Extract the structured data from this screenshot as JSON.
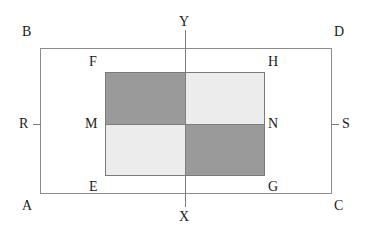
{
  "figure": {
    "type": "geometry-diagram",
    "colors": {
      "background": "#ffffff",
      "outline": "#8c8c8c",
      "inner_outline": "#7a7a7a",
      "axis": "#7d7d7d",
      "shade_dark": "#9a9a9a",
      "shade_light": "#ececec",
      "label_text": "#1a1a1a"
    },
    "outer_rect": {
      "corner_labels": {
        "top_left": "B",
        "top_right": "D",
        "bottom_left": "A",
        "bottom_right": "C"
      }
    },
    "inner_rect": {
      "corner_labels": {
        "top_left": "F",
        "top_right": "H",
        "bottom_left": "E",
        "bottom_right": "G"
      },
      "midline_labels": {
        "left": "M",
        "right": "N"
      },
      "quadrants": [
        {
          "position": "top-left",
          "shade": "dark"
        },
        {
          "position": "top-right",
          "shade": "light"
        },
        {
          "position": "bottom-left",
          "shade": "light"
        },
        {
          "position": "bottom-right",
          "shade": "dark"
        }
      ]
    },
    "axes": {
      "vertical": {
        "top_label": "Y",
        "bottom_label": "X"
      },
      "horizontal_ticks": {
        "left_label": "R",
        "right_label": "S"
      }
    }
  }
}
